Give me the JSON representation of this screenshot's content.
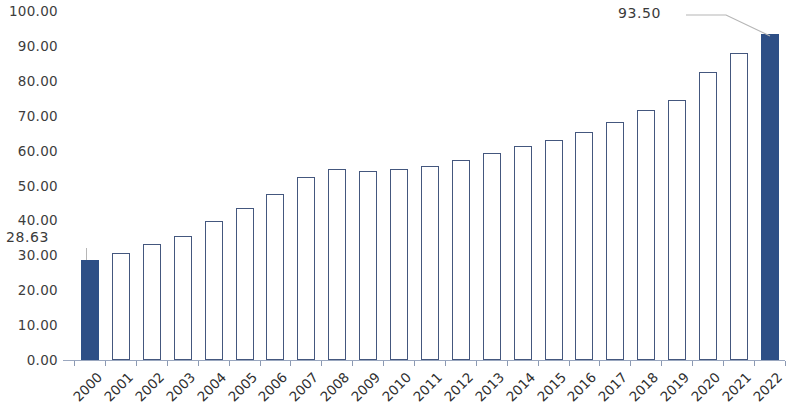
{
  "chart_data": {
    "type": "bar",
    "title": "",
    "subtitle": "",
    "xlabel": "",
    "ylabel": "",
    "categories": [
      "2000",
      "2001",
      "2002",
      "2003",
      "2004",
      "2005",
      "2006",
      "2007",
      "2008",
      "2009",
      "2010",
      "2011",
      "2012",
      "2013",
      "2014",
      "2015",
      "2016",
      "2017",
      "2018",
      "2019",
      "2020",
      "2021",
      "2022"
    ],
    "values": [
      28.63,
      30.8,
      33.2,
      35.6,
      39.8,
      43.5,
      47.6,
      52.5,
      54.7,
      54.2,
      54.6,
      55.7,
      57.4,
      59.2,
      61.4,
      63.1,
      65.2,
      68.3,
      71.6,
      74.6,
      82.6,
      87.9,
      93.5
    ],
    "ylim": [
      0,
      100
    ],
    "ytick_step": 10,
    "ytick_labels": [
      "0.00",
      "10.00",
      "20.00",
      "30.00",
      "40.00",
      "50.00",
      "60.00",
      "70.00",
      "80.00",
      "90.00",
      "100.00"
    ],
    "grid": false,
    "legend": null,
    "legend_position": "none",
    "annotations": [
      {
        "category": "2000",
        "value": 28.63,
        "text": "28.63",
        "leader": "vertical"
      },
      {
        "category": "2022",
        "value": 93.5,
        "text": "93.50",
        "leader": "diagonal"
      }
    ],
    "highlighted_categories": [
      "2000",
      "2022"
    ],
    "bar_fill_highlight": "#2e4f86",
    "bar_fill_default": "#ffffff",
    "bar_border": "#44577e",
    "axis_color": "#9aa7bf",
    "label_color": "#3a3a3a",
    "leader_color": "#b6b6b6",
    "x_label_rotation": -45
  }
}
